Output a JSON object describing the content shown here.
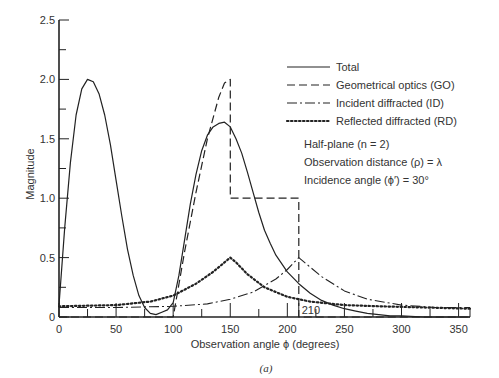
{
  "chart_data": {
    "type": "line",
    "title": "",
    "caption": "(a)",
    "xlabel": "Observation angle ϕ (degrees)",
    "ylabel": "Magnitude",
    "xlim": [
      0,
      360
    ],
    "ylim": [
      0,
      2.5
    ],
    "xticks": [
      0,
      50,
      100,
      150,
      200,
      250,
      300,
      350
    ],
    "yticks": [
      0,
      0.5,
      1.0,
      1.5,
      2.0,
      2.5
    ],
    "ytick_labels": [
      "0",
      "0.5",
      "1.0",
      "1.5",
      "2.0",
      "2.5"
    ],
    "annotations": [
      "210"
    ],
    "grid": false,
    "legend_position": "upper right",
    "legend": [
      {
        "label": "Total",
        "style": "solid"
      },
      {
        "label": "Geometrical optics (GO)",
        "style": "dashed"
      },
      {
        "label": "Incident diffracted (ID)",
        "style": "dash-dot"
      },
      {
        "label": "Reflected diffracted (RD)",
        "style": "dotted"
      }
    ],
    "notes": [
      "Half-plane (n = 2)",
      "Observation distance (ρ) = λ",
      "Incidence angle (ϕ′) = 30°"
    ],
    "series": [
      {
        "name": "Total",
        "style": "solid",
        "x": [
          0,
          5,
          10,
          15,
          20,
          25,
          30,
          35,
          40,
          45,
          50,
          55,
          60,
          65,
          70,
          75,
          80,
          85,
          90,
          95,
          100,
          105,
          110,
          115,
          120,
          125,
          130,
          135,
          140,
          145,
          150,
          155,
          160,
          165,
          170,
          175,
          180,
          185,
          190,
          200,
          210,
          220,
          230,
          240,
          250,
          260,
          270,
          280,
          290,
          300,
          320,
          340,
          360
        ],
        "y": [
          0.1,
          0.75,
          1.3,
          1.7,
          1.92,
          2.0,
          1.98,
          1.88,
          1.7,
          1.45,
          1.15,
          0.85,
          0.57,
          0.35,
          0.18,
          0.08,
          0.03,
          0.02,
          0.04,
          0.06,
          0.12,
          0.35,
          0.65,
          0.95,
          1.2,
          1.4,
          1.53,
          1.6,
          1.63,
          1.64,
          1.6,
          1.5,
          1.38,
          1.22,
          1.05,
          0.88,
          0.73,
          0.62,
          0.52,
          0.38,
          0.28,
          0.2,
          0.14,
          0.1,
          0.07,
          0.05,
          0.03,
          0.02,
          0.01,
          0.01,
          0.0,
          0.0,
          0.0
        ]
      },
      {
        "name": "Geometrical optics (GO)",
        "style": "dashed",
        "x": [
          0,
          70,
          80,
          90,
          100,
          110,
          120,
          130,
          140,
          145,
          150,
          150,
          210,
          210,
          360
        ],
        "y": [
          0.0,
          0.0,
          0.0,
          0.0,
          0.0,
          0.55,
          1.05,
          1.5,
          1.85,
          1.97,
          2.0,
          1.0,
          1.0,
          0.0,
          0.0
        ]
      },
      {
        "name": "Incident diffracted (ID)",
        "style": "dash-dot",
        "x": [
          0,
          50,
          100,
          130,
          150,
          170,
          190,
          200,
          205,
          210,
          215,
          230,
          250,
          270,
          300,
          330,
          360
        ],
        "y": [
          0.08,
          0.08,
          0.09,
          0.11,
          0.15,
          0.21,
          0.32,
          0.4,
          0.45,
          0.5,
          0.46,
          0.34,
          0.22,
          0.15,
          0.1,
          0.08,
          0.08
        ]
      },
      {
        "name": "Reflected diffracted (RD)",
        "style": "dotted",
        "x": [
          0,
          50,
          80,
          100,
          120,
          135,
          145,
          150,
          155,
          165,
          180,
          200,
          220,
          250,
          280,
          320,
          360
        ],
        "y": [
          0.09,
          0.1,
          0.13,
          0.18,
          0.28,
          0.38,
          0.46,
          0.5,
          0.46,
          0.36,
          0.25,
          0.17,
          0.13,
          0.1,
          0.09,
          0.08,
          0.07
        ]
      }
    ]
  }
}
